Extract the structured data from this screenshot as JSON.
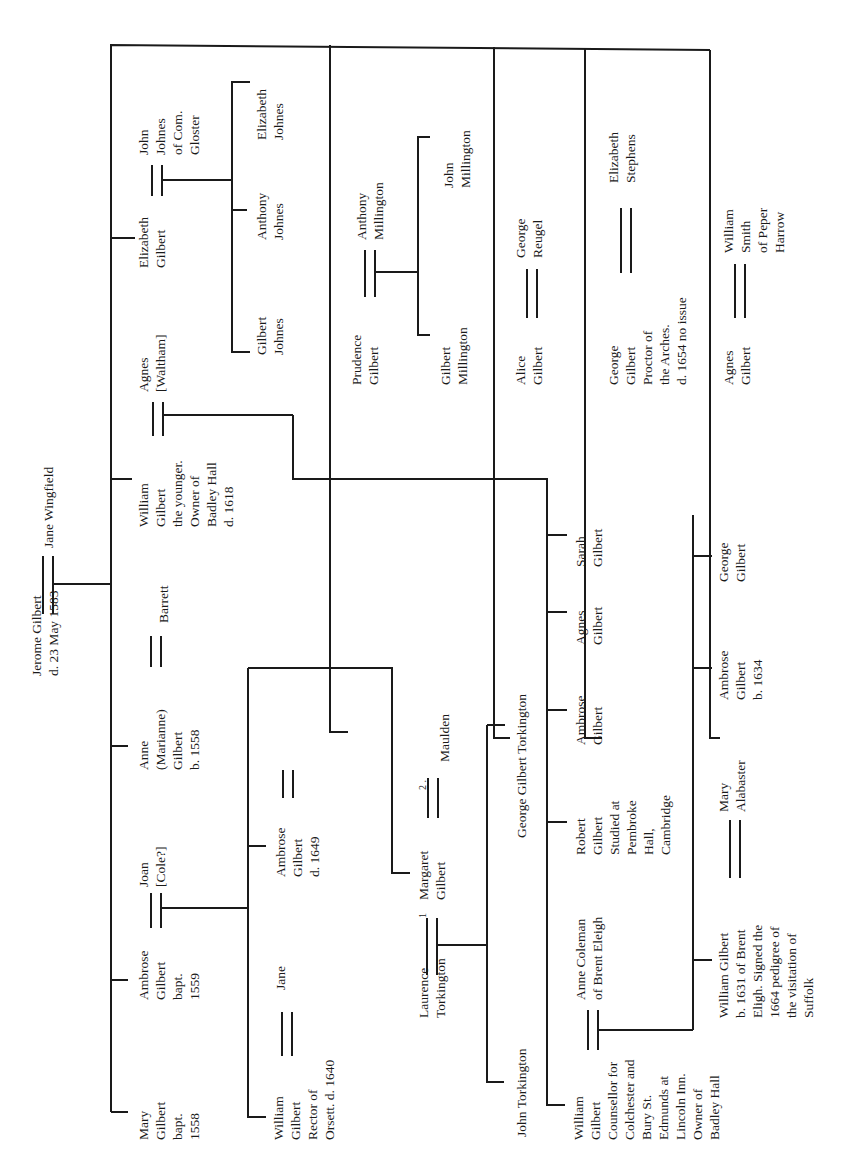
{
  "orientation": "rotated 90 degrees counter-clockwise",
  "progenitors": {
    "husband": "Jerome Gilbert\nd. 23 May 1583",
    "wife": "Jane Wingfield"
  },
  "children": [
    {
      "id": "mary",
      "label": "Mary\nGilbert\nbapt.\n1558"
    },
    {
      "id": "ambrose",
      "label": "Ambrose\nGilbert\nbapt.\n1559",
      "spouse": "Joan\n[Cole?]"
    },
    {
      "id": "anne",
      "label": "Anne\n(Marianne)\nGilbert\nb. 1558",
      "spouse": "Barrett"
    },
    {
      "id": "william",
      "label": "William\nGilbert\nthe younger.\nOwner of\nBadley Hall\nd. 1618",
      "spouse": "Agnes\n[Waltham]"
    },
    {
      "id": "elizabeth",
      "label": "Elizabeth\nGilbert",
      "spouse": "John\nJohnes\nof Com.\nGloster"
    },
    {
      "id": "prudence",
      "label": "Prudence\nGilbert",
      "spouse": "Anthony\nMillington"
    },
    {
      "id": "alice",
      "label": "Alice\nGilbert",
      "spouse": "George\nReugel"
    },
    {
      "id": "george",
      "label": "George\nGilbert\nProctor of\nthe Arches.\nd. 1654 no issue",
      "spouse": "Elizabeth\nStephens"
    },
    {
      "id": "agnes",
      "label": "Agnes\nGilbert",
      "spouse": "William\nSmith\nof Peper\nHarrow"
    }
  ],
  "ambrose_children": [
    {
      "label": "William\nGilbert\nRector of\nOrsett. d. 1640",
      "spouse": "Jane"
    },
    {
      "label": "Ambrose\nGilbert\nd. 1649"
    },
    {
      "label": "Margaret\nGilbert",
      "spouse_1": "Laurence\nTorkington",
      "spouse_2": "Maulden",
      "mark_1": "1",
      "mark_2": "2 ."
    }
  ],
  "torkington_children": [
    {
      "label": "John Torkington"
    },
    {
      "label": "George Gilbert Torkington"
    }
  ],
  "johnes_children": [
    {
      "label": "Gilbert\nJohnes"
    },
    {
      "label": "Anthony\nJohnes"
    },
    {
      "label": "Elizabeth\nJohnes"
    }
  ],
  "millington_children": [
    {
      "label": "Gilbert\nMillington"
    },
    {
      "label": "John\nMillington"
    }
  ],
  "william_younger_children": [
    {
      "label": "William\nGilbert\nCounsellor for\nColchester and\nBury St.\nEdmunds at\nLincoln Inn.\nOwner of\nBadley Hall",
      "spouse": "Anne Coleman\nof Brent Eleigh"
    },
    {
      "label": "Robert\nGilbert\nStudied at\nPembroke\nHall,\nCambridge"
    },
    {
      "label": "Ambrose\nGilbert"
    },
    {
      "label": "Agnes\nGilbert"
    },
    {
      "label": "Sarah\nGilbert"
    }
  ],
  "counsellor_children": [
    {
      "label": "William Gilbert\nb. 1631 of Brent\nEligh. Signed the\n1664 pedigree of\nthe visitation of\nSuffolk",
      "spouse": "Mary\nAlabaster"
    },
    {
      "label": "Ambrose\nGilbert\nb. 1634"
    },
    {
      "label": "George\nGilbert"
    }
  ]
}
